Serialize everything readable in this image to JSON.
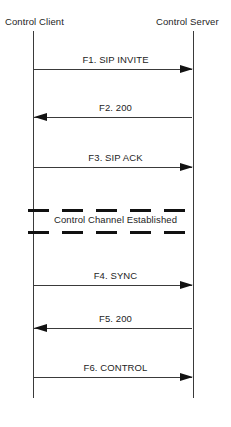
{
  "diagram": {
    "type": "sequence-diagram",
    "participants": [
      {
        "id": "control-client",
        "label": "Control Client"
      },
      {
        "id": "control-server",
        "label": "Control Server"
      }
    ],
    "messages": [
      {
        "id": "f1",
        "label": "F1. SIP INVITE",
        "direction": "right"
      },
      {
        "id": "f2",
        "label": "F2. 200",
        "direction": "left"
      },
      {
        "id": "f3",
        "label": "F3. SIP ACK",
        "direction": "right"
      },
      {
        "id": "f4",
        "label": "F4. SYNC",
        "direction": "right"
      },
      {
        "id": "f5",
        "label": "F5. 200",
        "direction": "left"
      },
      {
        "id": "f6",
        "label": "F6. CONTROL",
        "direction": "right"
      }
    ],
    "notes": [
      {
        "id": "control-channel",
        "label": "Control Channel Established"
      }
    ],
    "colors": {
      "line": "#3a3a3a",
      "arrow": "#121212",
      "text": "#242424",
      "background": "#ffffff"
    }
  }
}
